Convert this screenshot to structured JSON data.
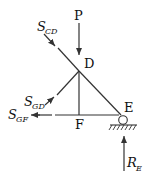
{
  "diagram": {
    "type": "free-body diagram of truss joint section",
    "nodes": {
      "D": {
        "label": "D"
      },
      "E": {
        "label": "E"
      },
      "F": {
        "label": "F"
      }
    },
    "forces": {
      "P": {
        "label": "P"
      },
      "S_CD": {
        "main": "S",
        "sub": "CD"
      },
      "S_GD": {
        "main": "S",
        "sub": "GD"
      },
      "S_GF": {
        "main": "S",
        "sub": "GF"
      },
      "R_E": {
        "main": "R",
        "sub": "E"
      }
    },
    "support": {
      "type": "roller",
      "at": "E"
    },
    "colors": {
      "line": "#333333",
      "background": "#ffffff"
    }
  }
}
